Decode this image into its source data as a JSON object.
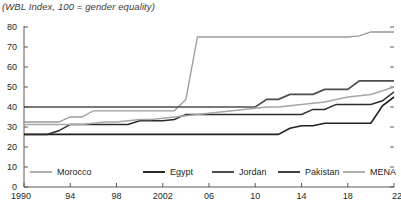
{
  "chart_data": {
    "type": "line",
    "title": "(WBL Index, 100 = gender equality)",
    "xlabel": "",
    "ylabel": "",
    "xlim": [
      1990,
      2022
    ],
    "ylim": [
      0,
      80
    ],
    "yticks": [
      0,
      10,
      20,
      30,
      40,
      50,
      60,
      70,
      80
    ],
    "ytick_labels": [
      "0",
      "10",
      "20",
      "30",
      "40",
      "50",
      "60",
      "70",
      "80"
    ],
    "xticks": [
      1990,
      1994,
      1998,
      2002,
      2006,
      2010,
      2014,
      2018,
      2022
    ],
    "xtick_labels": [
      "1990",
      "94",
      "98",
      "2002",
      "06",
      "10",
      "14",
      "18",
      "22"
    ],
    "grid": false,
    "legend_position": "bottom",
    "x": [
      1990,
      1991,
      1992,
      1993,
      1994,
      1995,
      1996,
      1997,
      1998,
      1999,
      2000,
      2001,
      2002,
      2003,
      2004,
      2005,
      2006,
      2007,
      2008,
      2009,
      2010,
      2011,
      2012,
      2013,
      2014,
      2015,
      2016,
      2017,
      2018,
      2019,
      2020,
      2021,
      2022
    ],
    "series": [
      {
        "name": "Morocco",
        "color": "#9a9a9a",
        "width": 1.3,
        "values": [
          32.5,
          32.5,
          32.5,
          32.5,
          35.0,
          35.0,
          38.1,
          38.1,
          38.1,
          38.1,
          38.1,
          38.1,
          38.1,
          38.1,
          43.8,
          75.0,
          75.0,
          75.0,
          75.0,
          75.0,
          75.0,
          75.0,
          75.0,
          75.0,
          75.0,
          75.0,
          75.0,
          75.0,
          75.0,
          75.6,
          77.5,
          77.5,
          77.5
        ]
      },
      {
        "name": "Egypt",
        "color": "#231f20",
        "width": 1.6,
        "values": [
          26.3,
          26.3,
          26.3,
          26.3,
          26.3,
          26.3,
          26.3,
          26.3,
          26.3,
          26.3,
          26.3,
          26.3,
          26.3,
          26.3,
          26.3,
          26.3,
          26.3,
          26.3,
          26.3,
          26.3,
          26.3,
          26.3,
          26.3,
          29.4,
          30.6,
          30.6,
          31.9,
          31.9,
          31.9,
          31.9,
          31.9,
          40.6,
          45.0
        ]
      },
      {
        "name": "Jordan",
        "color": "#4d4d4d",
        "width": 1.7,
        "values": [
          40.0,
          40.0,
          40.0,
          40.0,
          40.0,
          40.0,
          40.0,
          40.0,
          40.0,
          40.0,
          40.0,
          40.0,
          40.0,
          40.0,
          40.0,
          40.0,
          40.0,
          40.0,
          40.0,
          40.0,
          40.0,
          43.8,
          43.8,
          46.3,
          46.3,
          46.3,
          48.8,
          48.8,
          48.8,
          53.1,
          53.1,
          53.1,
          53.1
        ]
      },
      {
        "name": "Pakistan",
        "color": "#2b2b2b",
        "width": 1.5,
        "values": [
          26.3,
          26.3,
          26.3,
          28.1,
          31.3,
          31.3,
          31.3,
          31.3,
          31.3,
          31.3,
          33.1,
          33.1,
          33.1,
          33.8,
          36.3,
          36.3,
          36.3,
          36.3,
          36.3,
          36.3,
          36.3,
          36.3,
          36.3,
          36.3,
          36.3,
          38.8,
          38.8,
          41.3,
          41.3,
          41.3,
          41.3,
          43.1,
          47.5
        ]
      },
      {
        "name": "MENA",
        "color": "#a6a6a6",
        "width": 1.5,
        "values": [
          31.3,
          31.3,
          31.3,
          31.3,
          31.3,
          31.3,
          31.9,
          32.5,
          32.5,
          33.1,
          33.8,
          33.8,
          34.4,
          35.0,
          35.6,
          36.3,
          36.9,
          37.5,
          38.1,
          38.8,
          39.4,
          40.0,
          40.0,
          40.6,
          41.3,
          41.9,
          42.5,
          43.8,
          45.0,
          45.6,
          46.3,
          48.1,
          50.0
        ]
      }
    ]
  },
  "legend": {
    "items": [
      {
        "label": "Morocco"
      },
      {
        "label": "Egypt"
      },
      {
        "label": "Jordan"
      },
      {
        "label": "Pakistan"
      },
      {
        "label": "MENA"
      }
    ]
  }
}
